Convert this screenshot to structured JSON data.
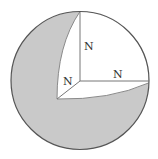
{
  "diagram": {
    "labels": {
      "vertical_axis": "N",
      "horizontal_axis": "N",
      "diagonal_axis": "N"
    },
    "colors": {
      "sphere_fill": "#c9c9c9",
      "cutout_fill": "#ffffff",
      "outline": "#555555",
      "axis_line": "#777777",
      "label": "#333333"
    }
  }
}
